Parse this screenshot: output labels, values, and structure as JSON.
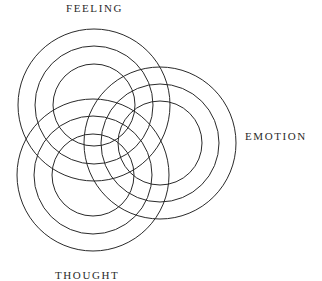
{
  "diagram": {
    "labels": {
      "feeling": "FEELING",
      "emotion": "EMOTION",
      "thought": "THOUGHT"
    },
    "stroke_color": "#2a2a2a",
    "background": "#ffffff",
    "circle_groups": [
      {
        "name": "feeling",
        "cx": 94,
        "cy": 105,
        "radii": [
          76,
          59,
          41
        ]
      },
      {
        "name": "emotion",
        "cx": 160,
        "cy": 143,
        "radii": [
          76,
          59,
          42
        ]
      },
      {
        "name": "thought",
        "cx": 93,
        "cy": 175,
        "radii": [
          76,
          59,
          41
        ]
      }
    ]
  }
}
